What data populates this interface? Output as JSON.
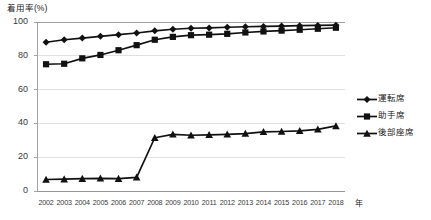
{
  "chart_data": {
    "type": "line",
    "title": "着用率(%)",
    "xlabel": "年",
    "ylabel": "着用率(%)",
    "ylim": [
      0,
      100
    ],
    "yticks": [
      0,
      20,
      40,
      60,
      80,
      100
    ],
    "grid": true,
    "legend_position": "right",
    "categories": [
      "2002",
      "2003",
      "2004",
      "2005",
      "2006",
      "2007",
      "2008",
      "2009",
      "2010",
      "2011",
      "2012",
      "2013",
      "2014",
      "2015",
      "2016",
      "2017",
      "2018"
    ],
    "series": [
      {
        "name": "運転席",
        "marker": "diamond",
        "color": "#111111",
        "values": [
          88,
          89.5,
          90.5,
          91.5,
          92.5,
          93.5,
          94.8,
          95.7,
          96.3,
          96.5,
          96.9,
          97.2,
          97.4,
          97.6,
          97.8,
          98.0,
          98.1
        ]
      },
      {
        "name": "助手席",
        "marker": "square",
        "color": "#111111",
        "values": [
          75,
          75.3,
          78.5,
          80.5,
          83.3,
          86.3,
          89.5,
          91.2,
          92.2,
          92.5,
          93.0,
          93.8,
          94.4,
          94.9,
          95.4,
          96.0,
          96.6
        ]
      },
      {
        "name": "後部座席",
        "marker": "triangle",
        "color": "#111111",
        "values": [
          6.8,
          7.0,
          7.3,
          7.5,
          7.3,
          8.1,
          31.5,
          33.5,
          33.0,
          33.2,
          33.5,
          34.0,
          35.0,
          35.2,
          35.6,
          36.5,
          38.5
        ]
      }
    ]
  },
  "legend": {
    "items": [
      {
        "label": "運転席"
      },
      {
        "label": "助手席"
      },
      {
        "label": "後部座席"
      }
    ]
  }
}
